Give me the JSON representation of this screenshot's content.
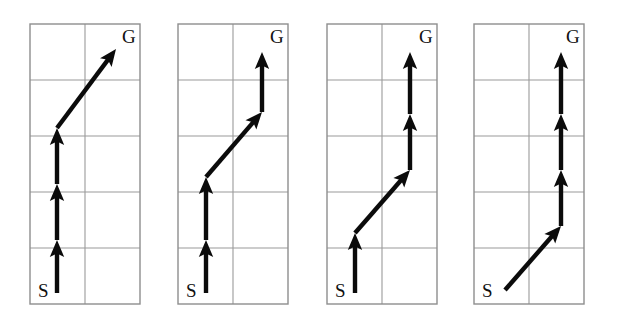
{
  "figure": {
    "title": "",
    "background_color": "#ffffff",
    "width": 618,
    "height": 322,
    "panel_count": 4
  },
  "chart_data": {
    "type": "diagram",
    "title": "",
    "xlabel": "",
    "ylabel": "",
    "grid": true,
    "legend": null,
    "grid_spec": {
      "rows": 5,
      "cols": 2,
      "cell_width": 55,
      "cell_height": 56,
      "line_color": "#9a9a9a",
      "border_color": "#8e8e8e"
    },
    "labels": {
      "start": "S",
      "goal": "G"
    },
    "colors": {
      "arrow": "#0b0b0b",
      "grid": "#9a9a9a",
      "background": "#ffffff",
      "text": "#111111"
    },
    "panels": [
      {
        "index": 1,
        "name": "panel-1",
        "origin_x": 30,
        "origin_y": 24,
        "start_label": "S",
        "goal_label": "G",
        "moves": [
          "up",
          "up",
          "up",
          "diagonal-up-right"
        ],
        "move_count": 4,
        "diagonal_position": 4,
        "segments": [
          {
            "type": "up",
            "x1": 57,
            "y1": 293,
            "x2": 57,
            "y2": 240
          },
          {
            "type": "up",
            "x1": 57,
            "y1": 240,
            "x2": 57,
            "y2": 184
          },
          {
            "type": "up",
            "x1": 57,
            "y1": 184,
            "x2": 57,
            "y2": 128
          },
          {
            "type": "diagonal",
            "x1": 57,
            "y1": 128,
            "x2": 116,
            "y2": 49
          }
        ]
      },
      {
        "index": 2,
        "name": "panel-2",
        "origin_x": 178,
        "origin_y": 24,
        "start_label": "S",
        "goal_label": "G",
        "moves": [
          "up",
          "up",
          "diagonal-up-right",
          "up"
        ],
        "move_count": 4,
        "diagonal_position": 3,
        "segments": [
          {
            "type": "up",
            "x1": 206,
            "y1": 293,
            "x2": 206,
            "y2": 240
          },
          {
            "type": "up",
            "x1": 206,
            "y1": 240,
            "x2": 206,
            "y2": 177
          },
          {
            "type": "diagonal",
            "x1": 206,
            "y1": 177,
            "x2": 262,
            "y2": 112
          },
          {
            "type": "up",
            "x1": 262,
            "y1": 112,
            "x2": 262,
            "y2": 52
          }
        ]
      },
      {
        "index": 3,
        "name": "panel-3",
        "origin_x": 327,
        "origin_y": 24,
        "start_label": "S",
        "goal_label": "G",
        "moves": [
          "up",
          "diagonal-up-right",
          "up",
          "up"
        ],
        "move_count": 4,
        "diagonal_position": 2,
        "segments": [
          {
            "type": "up",
            "x1": 355,
            "y1": 293,
            "x2": 355,
            "y2": 233
          },
          {
            "type": "diagonal",
            "x1": 355,
            "y1": 233,
            "x2": 410,
            "y2": 170
          },
          {
            "type": "up",
            "x1": 410,
            "y1": 170,
            "x2": 410,
            "y2": 114
          },
          {
            "type": "up",
            "x1": 410,
            "y1": 114,
            "x2": 410,
            "y2": 52
          }
        ]
      },
      {
        "index": 4,
        "name": "panel-4",
        "origin_x": 474,
        "origin_y": 24,
        "start_label": "S",
        "goal_label": "G",
        "moves": [
          "diagonal-up-right",
          "up",
          "up",
          "up"
        ],
        "move_count": 4,
        "diagonal_position": 1,
        "segments": [
          {
            "type": "diagonal",
            "x1": 505,
            "y1": 290,
            "x2": 561,
            "y2": 226
          },
          {
            "type": "up",
            "x1": 561,
            "y1": 226,
            "x2": 561,
            "y2": 170
          },
          {
            "type": "up",
            "x1": 561,
            "y1": 170,
            "x2": 561,
            "y2": 114
          },
          {
            "type": "up",
            "x1": 561,
            "y1": 114,
            "x2": 561,
            "y2": 52
          }
        ]
      }
    ]
  }
}
